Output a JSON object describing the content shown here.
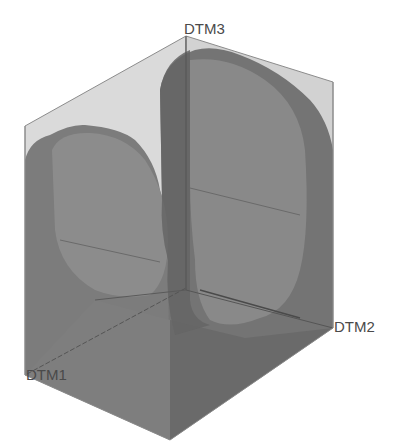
{
  "model": {
    "description": "Transparent rectangular block with two perpendicular semi-cylindrical cuts, shown with datum planes",
    "colors": {
      "background": "#ffffff",
      "block_light": "#d6d6d6",
      "block_mid": "#9a9a9a",
      "block_dark": "#7a7a7a",
      "solid": "#6e6e6e",
      "edge": "#8c8c8c",
      "datum_line": "#555555",
      "label": "#4a4a4a"
    }
  },
  "datums": {
    "dtm1": {
      "label": "DTM1"
    },
    "dtm2": {
      "label": "DTM2"
    },
    "dtm3": {
      "label": "DTM3"
    }
  }
}
